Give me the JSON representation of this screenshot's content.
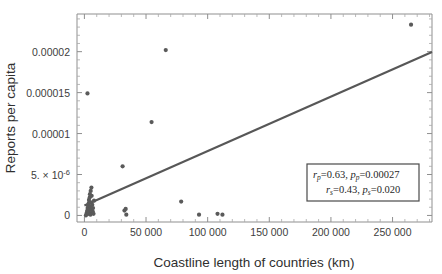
{
  "chart_data": {
    "type": "scatter",
    "title": "",
    "xlabel": "Coastline length of countries (km)",
    "ylabel": "Reports per capita",
    "xlim": [
      -6000,
      282000
    ],
    "ylim": [
      -8e-07,
      2.46e-05
    ],
    "grid": false,
    "legend": null,
    "xticks": [
      0,
      50000,
      100000,
      150000,
      200000,
      250000
    ],
    "xticklabels": [
      "0",
      "50 000",
      "100 000",
      "150 000",
      "200 000",
      "250 000"
    ],
    "yticks": [
      0,
      5e-06,
      1e-05,
      1.5e-05,
      2e-05
    ],
    "yticklabels": [
      "0",
      "5. × 10⁻⁶",
      "0.00001",
      "0.000015",
      "0.00002"
    ],
    "points": [
      {
        "x": 1200,
        "y": 0.0
      },
      {
        "x": 1800,
        "y": 2e-07
      },
      {
        "x": 2100,
        "y": 4e-07
      },
      {
        "x": 2400,
        "y": 6e-07
      },
      {
        "x": 2600,
        "y": 9e-07
      },
      {
        "x": 2900,
        "y": 1.2e-06
      },
      {
        "x": 3100,
        "y": 2e-07
      },
      {
        "x": 3300,
        "y": 5e-07
      },
      {
        "x": 3500,
        "y": 1.5e-06
      },
      {
        "x": 3700,
        "y": 1.9e-06
      },
      {
        "x": 3900,
        "y": 3e-07
      },
      {
        "x": 4100,
        "y": 8e-07
      },
      {
        "x": 4300,
        "y": 2.2e-06
      },
      {
        "x": 4500,
        "y": 2.6e-06
      },
      {
        "x": 4700,
        "y": 1.1e-06
      },
      {
        "x": 4900,
        "y": 1e-07
      },
      {
        "x": 5100,
        "y": 3e-06
      },
      {
        "x": 5300,
        "y": 1.6e-06
      },
      {
        "x": 5500,
        "y": 7e-07
      },
      {
        "x": 5700,
        "y": 3.4e-06
      },
      {
        "x": 5900,
        "y": 2.4e-06
      },
      {
        "x": 6100,
        "y": 3e-07
      },
      {
        "x": 6400,
        "y": 1.3e-06
      },
      {
        "x": 6700,
        "y": 5e-07
      },
      {
        "x": 7000,
        "y": 9e-07
      },
      {
        "x": 7400,
        "y": 2e-07
      },
      {
        "x": 7800,
        "y": 1.8e-06
      },
      {
        "x": 2500,
        "y": 1.49e-05
      },
      {
        "x": 31000,
        "y": 6e-06
      },
      {
        "x": 32500,
        "y": 6e-07
      },
      {
        "x": 33500,
        "y": 8e-07
      },
      {
        "x": 34000,
        "y": 1e-07
      },
      {
        "x": 54500,
        "y": 1.14e-05
      },
      {
        "x": 66000,
        "y": 2.02e-05
      },
      {
        "x": 78500,
        "y": 1.7e-06
      },
      {
        "x": 93000,
        "y": 1e-07
      },
      {
        "x": 108000,
        "y": 2e-07
      },
      {
        "x": 112000,
        "y": 1e-07
      },
      {
        "x": 265000,
        "y": 2.33e-05
      }
    ],
    "fit_line": {
      "x_start": 0,
      "y_start": 1.22e-06,
      "x_end": 282000,
      "y_end": 1.995e-05
    },
    "annotation": {
      "line1": {
        "r_symbol": "r",
        "r_sub": "p",
        "r_value": "=0.63, ",
        "p_symbol": "p",
        "p_sub": "p",
        "p_value": "=0.00027"
      },
      "line2": {
        "r_symbol": "r",
        "r_sub": "s",
        "r_value": "=0.43, ",
        "p_symbol": "p",
        "p_sub": "s",
        "p_value": "=0.020"
      }
    },
    "colors": {
      "point": "#5a5a5a",
      "line": "#575757",
      "axis": "#8f8f8f",
      "text": "#2f2f2f",
      "box_border": "#4a4a4a"
    }
  }
}
